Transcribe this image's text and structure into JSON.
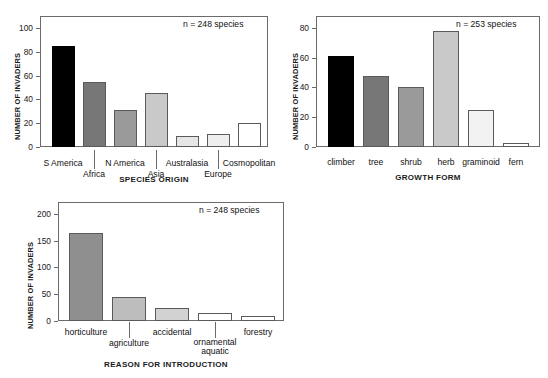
{
  "figure": {
    "background": "#ffffff",
    "axis_color": "#6b6b6b",
    "text_color": "#111111"
  },
  "palette": {
    "black": "#000000",
    "dark_gray": "#777777",
    "mid_gray": "#9a9a9a",
    "light_gray": "#c9c9c9",
    "pale_gray": "#e6e6e6",
    "white": "#ffffff"
  },
  "chart_data": [
    {
      "id": "species-origin",
      "type": "bar",
      "title": "",
      "xlabel": "SPECIES ORIGIN",
      "ylabel": "NUMBER OF INVADERS",
      "annotation": "n = 248 species",
      "categories": [
        "S America",
        "Africa",
        "N America",
        "Asia",
        "Australasia",
        "Europe",
        "Cosmopolitan"
      ],
      "values": [
        85,
        55,
        31,
        45,
        9,
        11,
        20
      ],
      "colors": [
        "#000000",
        "#777777",
        "#9a9a9a",
        "#c9c9c9",
        "#e6e6e6",
        "#eeeeee",
        "#ffffff"
      ],
      "label_rows": [
        0,
        1,
        0,
        1,
        0,
        1,
        0
      ],
      "yticks": [
        0,
        20,
        40,
        60,
        80,
        100
      ],
      "ylim": [
        0,
        110
      ],
      "grid": false,
      "legend": "none"
    },
    {
      "id": "growth-form",
      "type": "bar",
      "title": "",
      "xlabel": "GROWTH FORM",
      "ylabel": "NUMBER OF INVADERS",
      "annotation": "n = 253 species",
      "categories": [
        "climber",
        "tree",
        "shrub",
        "herb",
        "graminoid",
        "fern"
      ],
      "values": [
        61,
        48,
        40,
        78,
        25,
        3
      ],
      "colors": [
        "#000000",
        "#777777",
        "#9a9a9a",
        "#c9c9c9",
        "#f2f2f2",
        "#ffffff"
      ],
      "label_rows": [
        0,
        0,
        0,
        0,
        0,
        0
      ],
      "yticks": [
        0,
        20,
        40,
        60,
        80
      ],
      "ylim": [
        0,
        88
      ],
      "grid": false,
      "legend": "none"
    },
    {
      "id": "reason-for-introduction",
      "type": "bar",
      "title": "",
      "xlabel": "REASON FOR INTRODUCTION",
      "ylabel": "NUMBER OF INVADERS",
      "annotation": "n = 248 species",
      "categories": [
        "horticulture",
        "agriculture",
        "accidental",
        "ornamental aquatic",
        "forestry"
      ],
      "values": [
        165,
        45,
        25,
        14,
        10
      ],
      "colors": [
        "#8f8f8f",
        "#bdbdbd",
        "#d2d2d2",
        "#ffffff",
        "#ffffff"
      ],
      "label_rows": [
        0,
        1,
        0,
        1,
        0
      ],
      "yticks": [
        0,
        50,
        100,
        150,
        200
      ],
      "ylim": [
        0,
        222
      ],
      "grid": false,
      "legend": "none"
    }
  ]
}
